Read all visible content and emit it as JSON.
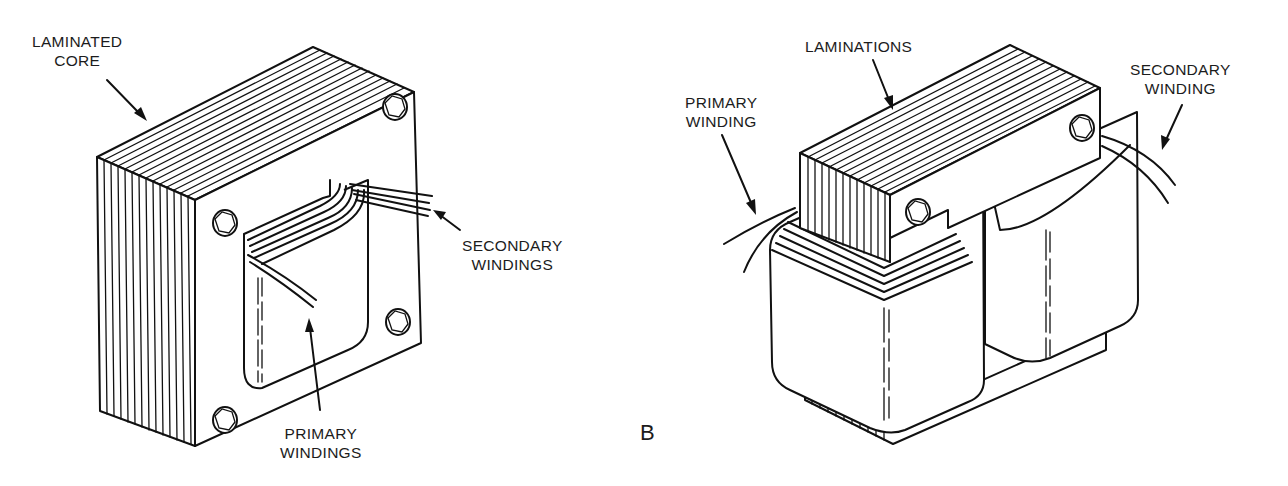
{
  "figure_a": {
    "labels": {
      "laminated_core": [
        "LAMINATED",
        "CORE"
      ],
      "secondary_windings": [
        "SECONDARY",
        "WINDINGS"
      ],
      "primary_windings": [
        "PRIMARY",
        "WINDINGS"
      ]
    }
  },
  "figure_b": {
    "letter": "B",
    "labels": {
      "laminations": "LAMINATIONS",
      "primary_winding": [
        "PRIMARY",
        "WINDING"
      ],
      "secondary_winding": [
        "SECONDARY",
        "WINDING"
      ]
    }
  }
}
